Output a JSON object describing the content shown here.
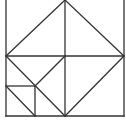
{
  "figure": {
    "stroke_color": "#333333",
    "background": "#ffffff",
    "stroke_width": 1.3
  },
  "segments": [
    {
      "name": "outer-left-edge",
      "x1": 6,
      "y1": 0,
      "x2": 6,
      "y2": 116
    },
    {
      "name": "outer-right-edge",
      "x1": 124,
      "y1": 0,
      "x2": 124,
      "y2": 116
    },
    {
      "name": "outer-bottom-edge",
      "x1": 6,
      "y1": 116,
      "x2": 124,
      "y2": 116
    },
    {
      "name": "center-vertical",
      "x1": 65,
      "y1": 0,
      "x2": 65,
      "y2": 116
    },
    {
      "name": "middle-horizontal",
      "x1": 6,
      "y1": 56,
      "x2": 124,
      "y2": 56
    },
    {
      "name": "diamond-top-left",
      "x1": 65,
      "y1": 0,
      "x2": 6,
      "y2": 56
    },
    {
      "name": "diamond-top-right",
      "x1": 65,
      "y1": 0,
      "x2": 124,
      "y2": 56
    },
    {
      "name": "diamond-bottom-right",
      "x1": 124,
      "y1": 56,
      "x2": 65,
      "y2": 116
    },
    {
      "name": "diamond-bottom-left",
      "x1": 6,
      "y1": 56,
      "x2": 65,
      "y2": 116
    },
    {
      "name": "inner-diagonal",
      "x1": 65,
      "y1": 56,
      "x2": 35,
      "y2": 86
    },
    {
      "name": "small-square-top",
      "x1": 6,
      "y1": 86,
      "x2": 35,
      "y2": 86
    },
    {
      "name": "small-square-right",
      "x1": 35,
      "y1": 86,
      "x2": 35,
      "y2": 116
    },
    {
      "name": "small-square-diagonal",
      "x1": 6,
      "y1": 86,
      "x2": 35,
      "y2": 116
    }
  ]
}
